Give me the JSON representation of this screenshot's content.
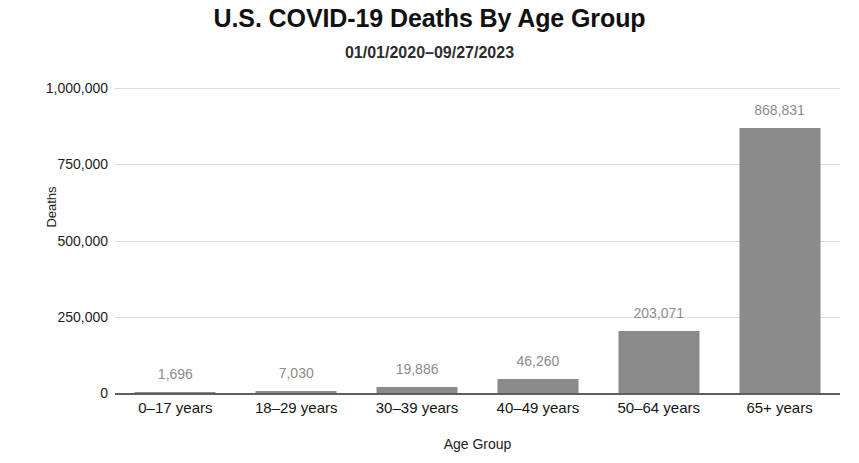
{
  "chart_data": {
    "type": "bar",
    "title": "U.S. COVID-19 Deaths By Age Group",
    "subtitle": "01/01/2020–09/27/2023",
    "xlabel": "Age Group",
    "ylabel": "Deaths",
    "categories": [
      "0–17 years",
      "18–29 years",
      "30–39 years",
      "40–49 years",
      "50–64 years",
      "65+ years"
    ],
    "values": [
      1696,
      7030,
      19886,
      46260,
      203071,
      868831
    ],
    "value_labels": [
      "1,696",
      "7,030",
      "19,886",
      "46,260",
      "203,071",
      "868,831"
    ],
    "ylim": [
      0,
      1000000
    ],
    "y_ticks": [
      0,
      250000,
      500000,
      750000,
      1000000
    ],
    "y_tick_labels": [
      "0",
      "250,000",
      "500,000",
      "750,000",
      "1,000,000"
    ],
    "grid": true,
    "legend": false,
    "bar_color": "#8a8a8a",
    "grid_color": "#dcdcdc",
    "axis_color": "#5e5e5e",
    "label_color": "#8c8c8c"
  }
}
